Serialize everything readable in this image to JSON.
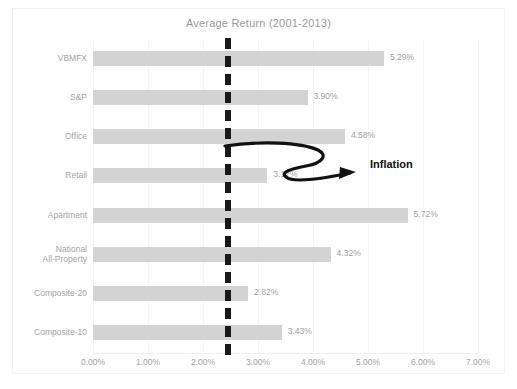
{
  "chart_data": {
    "type": "bar",
    "orientation": "horizontal",
    "title": "Average Return (2001-2013)",
    "xlabel": "",
    "ylabel": "",
    "xlim": [
      0,
      7
    ],
    "xticks": [
      "0.00%",
      "1.00%",
      "2.00%",
      "3.00%",
      "4.00%",
      "5.00%",
      "6.00%",
      "7.00%"
    ],
    "xtick_values": [
      0,
      1,
      2,
      3,
      4,
      5,
      6,
      7
    ],
    "grid": true,
    "legend": "none",
    "categories": [
      "VBMFX",
      "S&P",
      "Office",
      "Retail",
      "Apartment",
      "National\nAll-Property",
      "Composite-20",
      "Composite-10"
    ],
    "values": [
      5.29,
      3.9,
      4.58,
      3.17,
      5.72,
      4.32,
      2.82,
      3.43
    ],
    "value_labels": [
      "5.29%",
      "3.90%",
      "4.58%",
      "3.17%",
      "5.72%",
      "4.32%",
      "2.82%",
      "3.43%"
    ],
    "bar_color": "#d3d3d3",
    "annotations": [
      {
        "name": "inflation-reference-line",
        "label": "Inflation",
        "value": 2.45,
        "style": "dashed-vertical",
        "color": "#1a1a1a"
      }
    ]
  },
  "colors": {
    "bar": "#d3d3d3",
    "text": "#a3a3a3",
    "title": "#9a9a9a",
    "annotation": "#111111",
    "grid": "#f4f4f4",
    "border": "#f2f2f2"
  }
}
